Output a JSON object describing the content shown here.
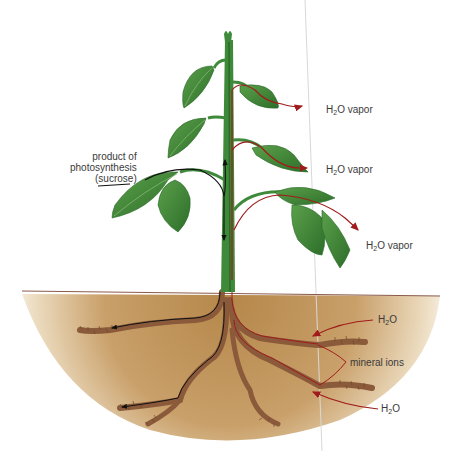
{
  "diagram": {
    "colors": {
      "soil": "#b98a4e",
      "soil_light": "#f3e6cf",
      "stem": "#3f8a3a",
      "leaf": "#3d8a36",
      "leaf_dark": "#2a6a28",
      "root": "#8a5a3a",
      "water_arrow": "#a01c1c",
      "sucrose_arrow": "#1a1a1a",
      "ground_line": "#8a5a4a"
    },
    "labels": {
      "sucrose": {
        "line1": "product of",
        "line2": "photosynthesis",
        "line3": "(sucrose)"
      },
      "vapor1": {
        "pre": "H",
        "sub": "2",
        "post": "O vapor"
      },
      "vapor2": {
        "pre": "H",
        "sub": "2",
        "post": "O vapor"
      },
      "vapor3": {
        "pre": "H",
        "sub": "2",
        "post": "O vapor"
      },
      "water_top": {
        "pre": "H",
        "sub": "2",
        "post": "O"
      },
      "minerals": "mineral ions",
      "water_bottom": {
        "pre": "H",
        "sub": "2",
        "post": "O"
      }
    }
  }
}
